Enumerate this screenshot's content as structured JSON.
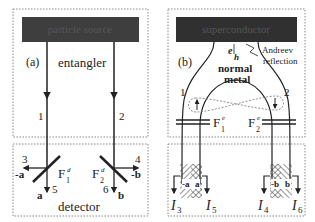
{
  "panel_a": {
    "tag": "(a)",
    "source_label": "particle source",
    "entangler_label": "entangler",
    "detector_label": "detector",
    "lead1": "1",
    "lead2": "2",
    "out3": "3",
    "out4": "4",
    "out5": "5",
    "out6": "6",
    "minus_a": "-a",
    "plus_a": "a",
    "minus_b": "-b",
    "plus_b": "b",
    "filter1": "F",
    "filter1_sub": "1",
    "filter1_sup": "d",
    "filter2": "F",
    "filter2_sub": "2",
    "filter2_sup": "d"
  },
  "panel_b": {
    "tag": "(b)",
    "source_label": "superconductor",
    "eh_e": "e",
    "eh_h": "h",
    "andreev1": "Andreev",
    "andreev2": "reflection",
    "normal": "normal",
    "metal": "metal",
    "lead1": "1",
    "lead2": "2",
    "filter1": "F",
    "filter1_sub": "1",
    "filter1_sup": "e",
    "filter2": "F",
    "filter2_sub": "2",
    "filter2_sup": "e",
    "minus_a": "-a",
    "plus_a": "a",
    "minus_b": "-b",
    "plus_b": "b",
    "I": "I",
    "I3": "3",
    "I5": "5",
    "I4": "4",
    "I6": "6"
  },
  "colors": {
    "bar": "#3a3a3a",
    "line": "#222222",
    "dash": "#888888"
  }
}
